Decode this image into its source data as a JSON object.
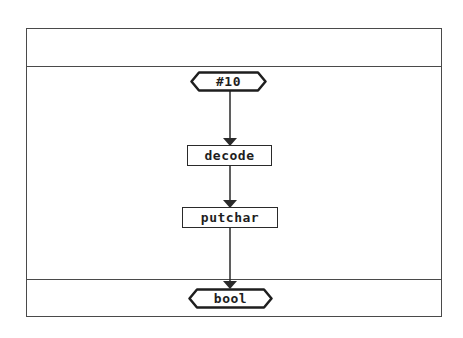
{
  "diagram": {
    "type": "flowchart",
    "colors": {
      "line": "#2a2a2a",
      "frame": "#4a4a4a",
      "background": "#ffffff"
    },
    "nodes": [
      {
        "id": "input",
        "shape": "hexagon",
        "label": "#10"
      },
      {
        "id": "decode",
        "shape": "rectangle",
        "label": "decode"
      },
      {
        "id": "putchar",
        "shape": "rectangle",
        "label": "putchar"
      },
      {
        "id": "output",
        "shape": "hexagon",
        "label": "bool"
      }
    ],
    "edges": [
      {
        "from": "input",
        "to": "decode"
      },
      {
        "from": "decode",
        "to": "putchar"
      },
      {
        "from": "putchar",
        "to": "output"
      }
    ]
  }
}
